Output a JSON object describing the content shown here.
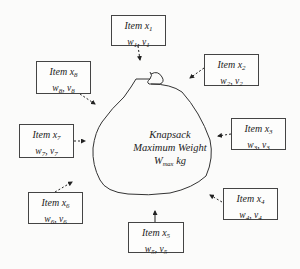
{
  "knapsack": {
    "line1": "Knapsack",
    "line2": "Maximum Weight",
    "weight_symbol": "W",
    "weight_sub": "max",
    "weight_unit": " kg"
  },
  "items": [
    {
      "title": "Item x",
      "sub": "1",
      "w": "w",
      "w_sub": "1",
      "v": "v",
      "v_sub": "1"
    },
    {
      "title": "Item x",
      "sub": "2",
      "w": "w",
      "w_sub": "2",
      "v": "v",
      "v_sub": "2"
    },
    {
      "title": "Item x",
      "sub": "3",
      "w": "w",
      "w_sub": "3",
      "v": "v",
      "v_sub": "3"
    },
    {
      "title": "Item x",
      "sub": "4",
      "w": "w",
      "w_sub": "4",
      "v": "v",
      "v_sub": "4"
    },
    {
      "title": "Item x",
      "sub": "5",
      "w": "w",
      "w_sub": "5",
      "v": "v",
      "v_sub": "5"
    },
    {
      "title": "Item x",
      "sub": "6",
      "w": "w",
      "w_sub": "6",
      "v": "v",
      "v_sub": "6"
    },
    {
      "title": "Item x",
      "sub": "7",
      "w": "w",
      "w_sub": "7",
      "v": "v",
      "v_sub": "7"
    },
    {
      "title": "Item x",
      "sub": "8",
      "w": "w",
      "w_sub": "8",
      "v": "v",
      "v_sub": "8"
    }
  ],
  "separator": ", ",
  "colors": {
    "stroke": "#333333",
    "background": "#fbfbfa"
  }
}
